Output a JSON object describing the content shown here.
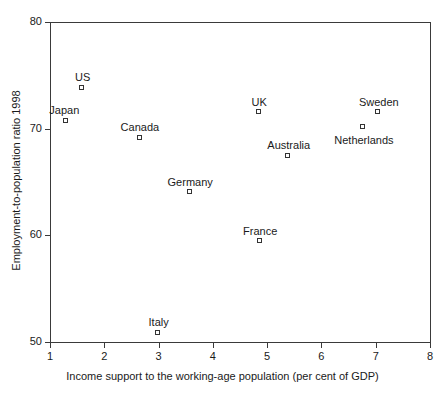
{
  "chart_data": {
    "type": "scatter",
    "title": "",
    "xlabel": "Income support to the working-age population (per cent of GDP)",
    "ylabel": "Employment-to-population ratio 1998",
    "xlim": [
      1,
      8
    ],
    "ylim": [
      50,
      80
    ],
    "xticks": [
      "1",
      "2",
      "3",
      "4",
      "5",
      "6",
      "7",
      "8"
    ],
    "yticks": [
      "50",
      "60",
      "70",
      "80"
    ],
    "grid": false,
    "legend": "none",
    "marker_style": "open-square",
    "marker_color": "#333333",
    "points": [
      {
        "label": "Japan",
        "x": 1.3,
        "y": 70.7,
        "label_pos": "above-left"
      },
      {
        "label": "US",
        "x": 1.6,
        "y": 73.8,
        "label_pos": "above"
      },
      {
        "label": "Canada",
        "x": 2.66,
        "y": 69.1,
        "label_pos": "above"
      },
      {
        "label": "Italy",
        "x": 3.0,
        "y": 50.8,
        "label_pos": "above"
      },
      {
        "label": "Germany",
        "x": 3.58,
        "y": 64.0,
        "label_pos": "above"
      },
      {
        "label": "France",
        "x": 4.87,
        "y": 59.4,
        "label_pos": "above"
      },
      {
        "label": "UK",
        "x": 4.85,
        "y": 71.5,
        "label_pos": "above"
      },
      {
        "label": "Australia",
        "x": 5.4,
        "y": 67.4,
        "label_pos": "above"
      },
      {
        "label": "Netherlands",
        "x": 6.78,
        "y": 70.1,
        "label_pos": "below"
      },
      {
        "label": "Sweden",
        "x": 7.06,
        "y": 71.5,
        "label_pos": "above"
      }
    ]
  }
}
